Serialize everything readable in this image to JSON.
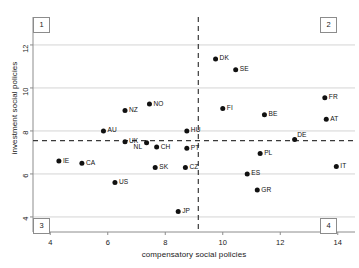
{
  "chart_data": {
    "type": "scatter",
    "title": "",
    "xlabel": "compensatory social policies",
    "ylabel": "investment social policies",
    "xlim": [
      3.4,
      14.6
    ],
    "ylim": [
      3.3,
      13.3
    ],
    "xticks": [
      4,
      6,
      8,
      10,
      12,
      14
    ],
    "yticks": [
      4,
      6,
      8,
      10,
      12
    ],
    "grid": "horizontal",
    "legend": "none",
    "reference_lines": {
      "vertical_x": 9.15,
      "horizontal_y": 7.55,
      "style": "dashed"
    },
    "quadrant_labels": [
      "1",
      "2",
      "3",
      "4"
    ],
    "points": [
      {
        "label": "DK",
        "x": 9.75,
        "y": 11.35,
        "label_pos": "right"
      },
      {
        "label": "SE",
        "x": 10.45,
        "y": 10.85,
        "label_pos": "right"
      },
      {
        "label": "FR",
        "x": 13.55,
        "y": 9.55,
        "label_pos": "right"
      },
      {
        "label": "NO",
        "x": 7.45,
        "y": 9.25,
        "label_pos": "right"
      },
      {
        "label": "FI",
        "x": 10.0,
        "y": 9.05,
        "label_pos": "right"
      },
      {
        "label": "BE",
        "x": 11.45,
        "y": 8.75,
        "label_pos": "right"
      },
      {
        "label": "AT",
        "x": 13.6,
        "y": 8.55,
        "label_pos": "right"
      },
      {
        "label": "NZ",
        "x": 6.6,
        "y": 8.95,
        "label_pos": "right"
      },
      {
        "label": "HU",
        "x": 8.75,
        "y": 8.0,
        "label_pos": "right"
      },
      {
        "label": "AU",
        "x": 5.85,
        "y": 8.0,
        "label_pos": "right"
      },
      {
        "label": "UK",
        "x": 6.6,
        "y": 7.5,
        "label_pos": "right"
      },
      {
        "label": "NL",
        "x": 7.35,
        "y": 7.45,
        "label_pos": "left-below"
      },
      {
        "label": "CH",
        "x": 7.7,
        "y": 7.25,
        "label_pos": "right"
      },
      {
        "label": "PT",
        "x": 8.75,
        "y": 7.2,
        "label_pos": "right"
      },
      {
        "label": "DE",
        "x": 12.5,
        "y": 7.6,
        "label_pos": "right-above"
      },
      {
        "label": "PL",
        "x": 11.3,
        "y": 6.95,
        "label_pos": "right"
      },
      {
        "label": "IE",
        "x": 4.3,
        "y": 6.6,
        "label_pos": "right"
      },
      {
        "label": "CA",
        "x": 5.1,
        "y": 6.5,
        "label_pos": "right"
      },
      {
        "label": "SK",
        "x": 7.65,
        "y": 6.3,
        "label_pos": "right"
      },
      {
        "label": "CZ",
        "x": 8.7,
        "y": 6.3,
        "label_pos": "right"
      },
      {
        "label": "IT",
        "x": 13.95,
        "y": 6.35,
        "label_pos": "right"
      },
      {
        "label": "ES",
        "x": 10.85,
        "y": 6.0,
        "label_pos": "right"
      },
      {
        "label": "US",
        "x": 6.25,
        "y": 5.6,
        "label_pos": "right"
      },
      {
        "label": "GR",
        "x": 11.2,
        "y": 5.25,
        "label_pos": "right"
      },
      {
        "label": "JP",
        "x": 8.45,
        "y": 4.25,
        "label_pos": "right"
      }
    ]
  },
  "axes": {
    "x_title": "compensatory social policies",
    "y_title": "investment social policies",
    "x_tick_labels": [
      "4",
      "6",
      "8",
      "10",
      "12",
      "14"
    ],
    "y_tick_labels": [
      "4",
      "6",
      "8",
      "10",
      "12"
    ]
  },
  "quadrants": [
    {
      "name": "quadrant-1",
      "text": "1"
    },
    {
      "name": "quadrant-2",
      "text": "2"
    },
    {
      "name": "quadrant-3",
      "text": "3"
    },
    {
      "name": "quadrant-4",
      "text": "4"
    }
  ],
  "colors": {
    "point": "#111111",
    "gridline": "#c9c9c9",
    "axis": "#8c8c8c",
    "dashed": "#3a3a3a",
    "text": "#1a1a1a",
    "background": "#ffffff"
  }
}
